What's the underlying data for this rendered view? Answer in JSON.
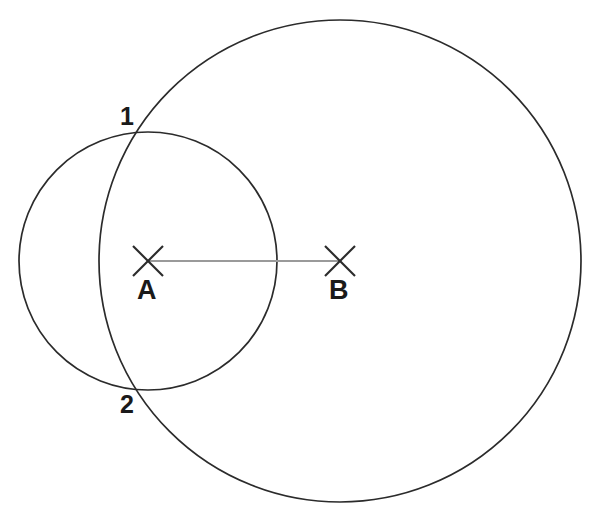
{
  "diagram": {
    "background_color": "#ffffff",
    "stroke_color": "#2b2b2b",
    "connector_color": "#9a9a9a",
    "label_color": "#1a1a1a",
    "canvas": {
      "width": 600,
      "height": 512
    },
    "centers": [
      {
        "id": "A",
        "label": "A",
        "marker": "x-marker",
        "x": 148,
        "y": 261,
        "label_x": 137,
        "label_y": 277
      },
      {
        "id": "B",
        "label": "B",
        "marker": "x-marker",
        "x": 340,
        "y": 261,
        "label_x": 329,
        "label_y": 277
      }
    ],
    "circles": [
      {
        "id": "small-circle",
        "name": "circle-centered-at-A",
        "cx": 148,
        "cy": 261,
        "r": 129
      },
      {
        "id": "large-circle",
        "name": "circle-centered-at-B",
        "cx": 340,
        "cy": 261,
        "r": 241
      }
    ],
    "connector": {
      "name": "segment-AB",
      "x1": 148,
      "y1": 261,
      "x2": 340,
      "y2": 261
    },
    "intersections": [
      {
        "id": "1",
        "label": "1",
        "x": 134,
        "y": 140,
        "label_x": 120,
        "label_y": 104
      },
      {
        "id": "2",
        "label": "2",
        "x": 134,
        "y": 382,
        "label_x": 120,
        "label_y": 392
      }
    ],
    "markers": {
      "x_arm_half_length": 15
    }
  }
}
